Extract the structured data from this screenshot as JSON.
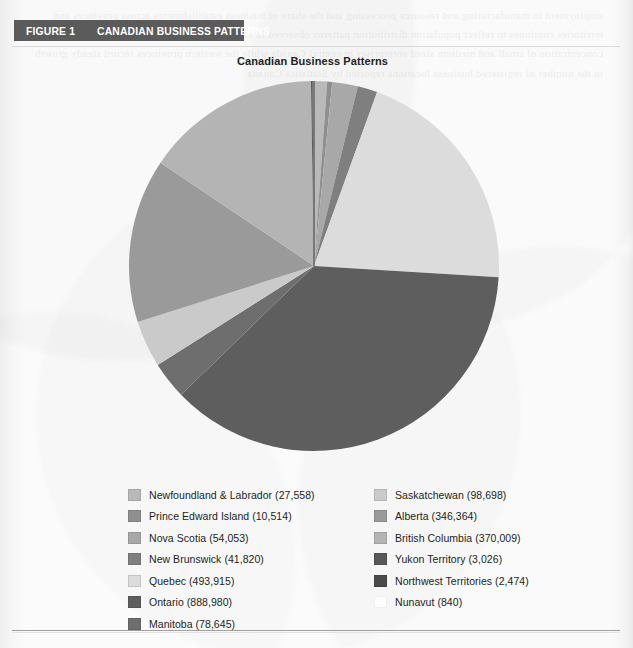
{
  "figure": {
    "number_label": "FIGURE 1",
    "title_label": "CANADIAN BUSINESS PATTERNS",
    "bar_color": "#5b5b5b"
  },
  "chart_title": "Canadian Business Patterns",
  "bleed_text": "employment in manufacturing and resource processing and the share of business establishments across provinces and territories continues to reflect population distribution patterns observed in earlier census periods including the relative concentration of small and medium sized enterprises in central Canada while the western provinces record steady growth in the number of registered business locations reported by Statistics Canada",
  "chart_data": {
    "type": "pie",
    "title": "Canadian Business Patterns",
    "total": 2416896,
    "start_angle_deg": 0,
    "direction": "clockwise",
    "legend_position": "bottom",
    "grid": false,
    "units": "number of business establishments",
    "categories": [
      "Newfoundland & Labrador",
      "Prince Edward Island",
      "Nova Scotia",
      "New Brunswick",
      "Quebec",
      "Ontario",
      "Manitoba",
      "Saskatchewan",
      "Alberta",
      "British Columbia",
      "Yukon Territory",
      "Northwest Territories",
      "Nunavut"
    ],
    "values": [
      27558,
      10514,
      54053,
      41820,
      493915,
      888980,
      78645,
      98698,
      346364,
      370009,
      3026,
      2474,
      840
    ],
    "colors": [
      "#b9b9b9",
      "#8f8f8f",
      "#a8a8a8",
      "#7f7f7f",
      "#dcdcdc",
      "#5e5e5e",
      "#6e6e6e",
      "#cacaca",
      "#9a9a9a",
      "#b4b4b4",
      "#585858",
      "#4a4a4a",
      "#fdfdfd"
    ]
  },
  "legend": {
    "left_column": [
      {
        "label": "Newfoundland & Labrador (27,558)",
        "color": "#b9b9b9"
      },
      {
        "label": "Prince Edward Island (10,514)",
        "color": "#8f8f8f"
      },
      {
        "label": "Nova Scotia (54,053)",
        "color": "#a8a8a8"
      },
      {
        "label": "New Brunswick (41,820)",
        "color": "#7f7f7f"
      },
      {
        "label": "Quebec (493,915)",
        "color": "#dcdcdc"
      },
      {
        "label": "Ontario (888,980)",
        "color": "#5e5e5e"
      },
      {
        "label": "Manitoba (78,645)",
        "color": "#6e6e6e"
      }
    ],
    "right_column": [
      {
        "label": "Saskatchewan (98,698)",
        "color": "#cacaca"
      },
      {
        "label": "Alberta (346,364)",
        "color": "#9a9a9a"
      },
      {
        "label": "British Columbia (370,009)",
        "color": "#b4b4b4"
      },
      {
        "label": "Yukon Territory (3,026)",
        "color": "#585858"
      },
      {
        "label": "Northwest Territories (2,474)",
        "color": "#4a4a4a"
      },
      {
        "label": "Nunavut (840)",
        "color": "#fdfdfd"
      }
    ]
  }
}
